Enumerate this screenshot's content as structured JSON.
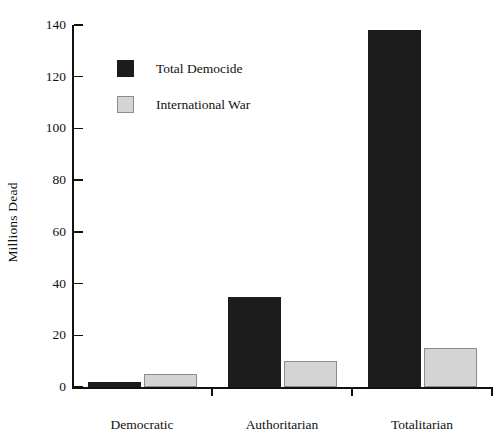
{
  "chart_data": {
    "type": "bar",
    "title": "",
    "xlabel": "",
    "ylabel": "Millions Dead",
    "categories": [
      "Democratic",
      "Authoritarian",
      "Totalitarian"
    ],
    "series": [
      {
        "name": "Total Democide",
        "color": "#1c1c1c",
        "values": [
          2,
          35,
          138
        ]
      },
      {
        "name": "International War",
        "color": "#d4d4d4",
        "values": [
          5,
          10,
          15
        ]
      }
    ],
    "ylim": [
      0,
      140
    ],
    "yticks": [
      0,
      20,
      40,
      60,
      80,
      100,
      120,
      140
    ],
    "ytick_labels": [
      "0",
      "20",
      "40",
      "60",
      "80",
      "100",
      "120",
      "140"
    ],
    "grid": false,
    "legend_position": "upper-left"
  },
  "legend": {
    "entries": [
      {
        "label": "Total Democide",
        "swatch": "black-square-swatch"
      },
      {
        "label": "International War",
        "swatch": "gray-square-swatch"
      }
    ]
  }
}
